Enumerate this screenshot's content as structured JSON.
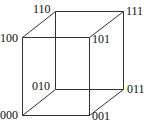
{
  "diagram": {
    "type": "3-bit hypercube (Boolean cube)",
    "vertices": [
      {
        "id": "000",
        "label": "000",
        "x": 22,
        "y": 115,
        "lx": 0,
        "ly": 109
      },
      {
        "id": "001",
        "label": "001",
        "x": 89,
        "y": 115,
        "lx": 92,
        "ly": 110
      },
      {
        "id": "010",
        "label": "010",
        "x": 55,
        "y": 89,
        "lx": 32,
        "ly": 80
      },
      {
        "id": "011",
        "label": "011",
        "x": 123,
        "y": 89,
        "lx": 127,
        "ly": 83
      },
      {
        "id": "100",
        "label": "100",
        "x": 22,
        "y": 37,
        "lx": 0,
        "ly": 32
      },
      {
        "id": "101",
        "label": "101",
        "x": 89,
        "y": 37,
        "lx": 92,
        "ly": 33
      },
      {
        "id": "110",
        "label": "110",
        "x": 55,
        "y": 11,
        "lx": 33,
        "ly": 3
      },
      {
        "id": "111",
        "label": "111",
        "x": 123,
        "y": 11,
        "lx": 126,
        "ly": 5
      }
    ],
    "edges": [
      [
        "000",
        "001"
      ],
      [
        "000",
        "010"
      ],
      [
        "000",
        "100"
      ],
      [
        "001",
        "011"
      ],
      [
        "001",
        "101"
      ],
      [
        "010",
        "011"
      ],
      [
        "010",
        "110"
      ],
      [
        "011",
        "111"
      ],
      [
        "100",
        "101"
      ],
      [
        "100",
        "110"
      ],
      [
        "101",
        "111"
      ],
      [
        "110",
        "111"
      ]
    ]
  }
}
